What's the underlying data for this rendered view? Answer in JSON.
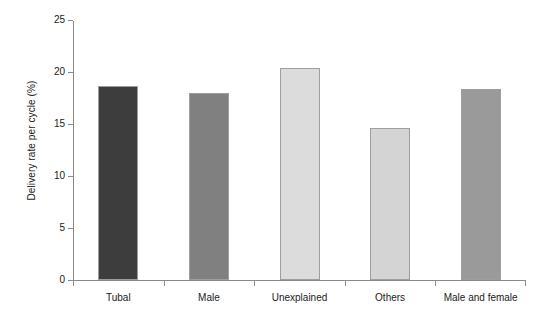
{
  "chart_data": {
    "type": "bar",
    "title": "",
    "xlabel": "",
    "ylabel": "Delivery rate per cycle (%)",
    "categories": [
      "Tubal",
      "Male",
      "Unexplained",
      "Others",
      "Male and female"
    ],
    "values": [
      18.7,
      18.0,
      20.4,
      14.6,
      18.4
    ],
    "ylim": [
      0,
      25
    ],
    "yticks": [
      0,
      5,
      10,
      15,
      20,
      25
    ],
    "ytick_labels": [
      "0",
      "5",
      "10",
      "15",
      "20",
      "25"
    ],
    "grid": false,
    "legend": "none",
    "bar_colors": [
      "#3d3d3d",
      "#808080",
      "#dcdcdc",
      "#d4d4d4",
      "#9a9a9a"
    ],
    "bar_edge_color": "#9e9e9e",
    "axis_color": "#8a8a8a",
    "background": "#ffffff"
  }
}
